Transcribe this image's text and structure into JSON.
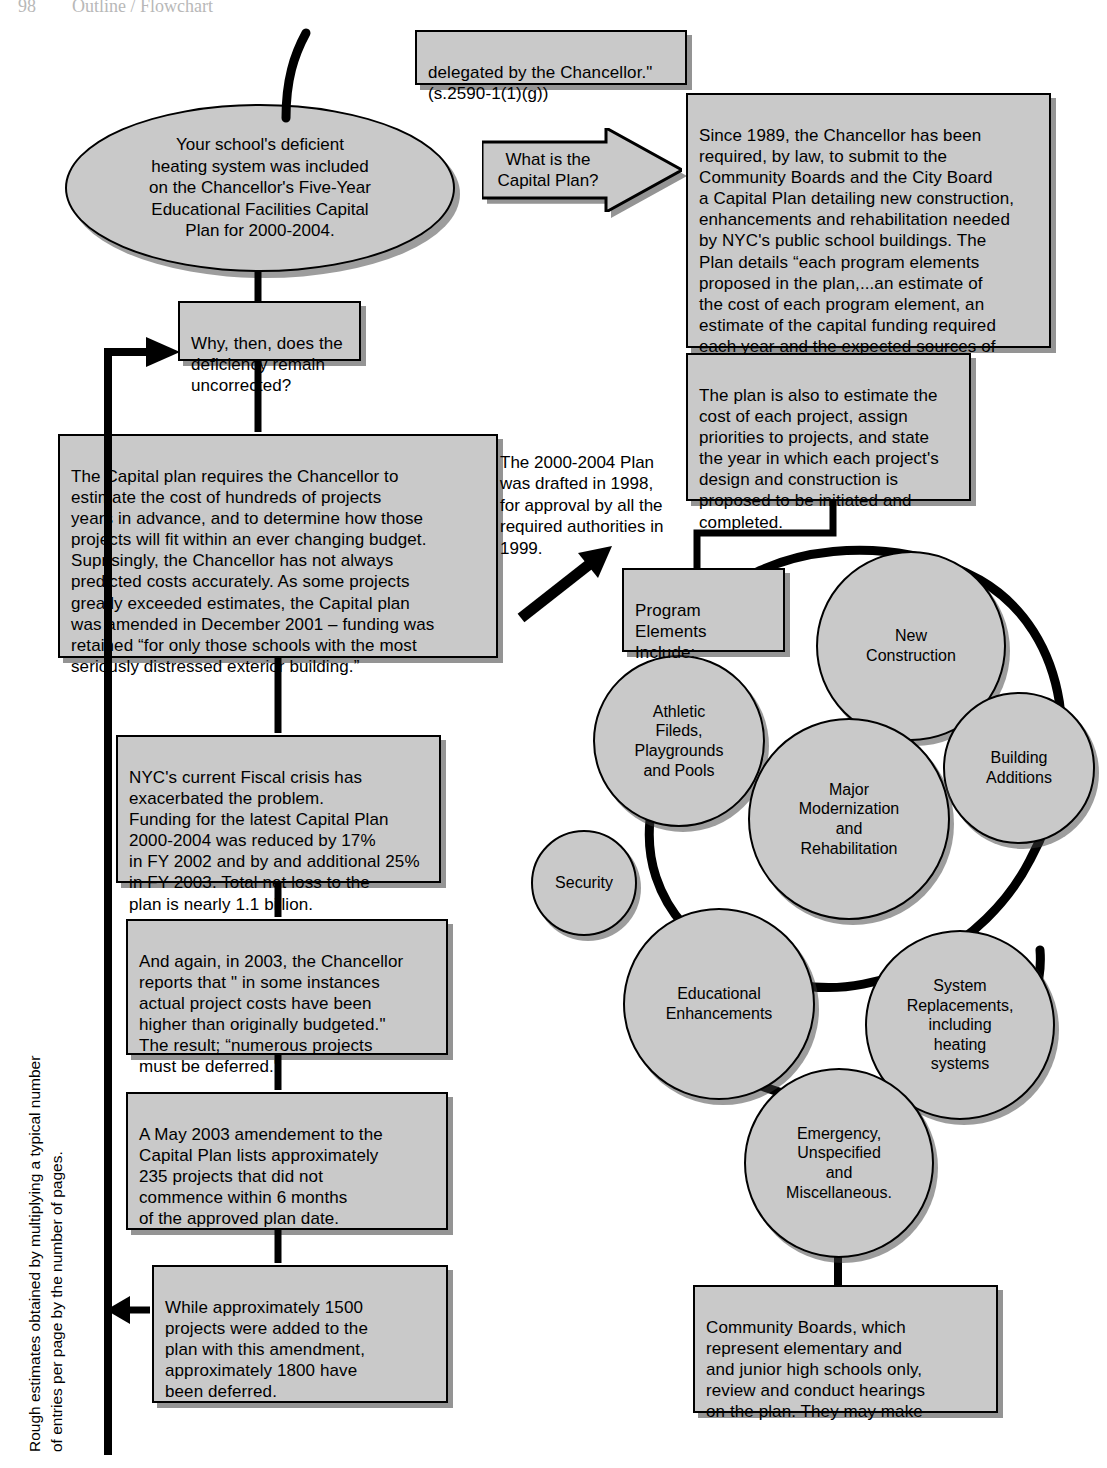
{
  "page": {
    "header_fragment": "98        Outline / Flowchart",
    "width": 1107,
    "height": 1468,
    "fill_color": "#c9c9c9",
    "line_color": "#000000"
  },
  "top_quote_box": {
    "text": "delegated by the Chancellor.\"\n(s.2590-1(1)(g))"
  },
  "start_ellipse": {
    "text": "Your school's deficient\nheating system was included\non the Chancellor's Five-Year\nEducational Facilities Capital\nPlan for 2000-2004."
  },
  "question_arrow": {
    "text": "What is the\nCapital Plan?"
  },
  "capital_plan_box": {
    "text": "Since 1989, the Chancellor has been\nrequired, by law, to submit to the\nCommunity Boards and the City Board\na Capital Plan detailing new construction,\nenhancements and rehabilitation needed\nby NYC's public school buildings. The\nPlan details “each program elements\nproposed in the plan,...an estimate of\nthe cost of each program element, an\nestimate of the capital funding required\neach year and the expected sources of\nsuch funding.” (NYEL s.2590.p)"
  },
  "plan_estimate_box": {
    "text": "The plan is also to estimate the\ncost of each project, assign\npriorities to projects, and state\nthe year in which each project's\ndesign and construction is\nproposed to be initiated and\ncompleted."
  },
  "why_box": {
    "text": "Why, then, does the\ndeficiency remain\nuncorrected?"
  },
  "requires_box": {
    "text": "The Capital plan requires the Chancellor to\nestimate the cost of hundreds of projects\nyears in advance, and to determine how those\nprojects will fit within an ever changing budget.\nSuprisingly, the Chancellor has not always\npredicted costs accurately. As some projects\ngreatly exceeded estimates, the Capital plan\nwas amended in December 2001 – funding was\nretained “for only those schools with the most\nseriously distressed exterior building.”"
  },
  "drafted_note": {
    "text": "The 2000-2004  Plan\nwas drafted in 1998,\nfor approval by all the\nrequired authorities in\n1999."
  },
  "fiscal_box": {
    "text": "NYC's current Fiscal crisis has\nexacerbated the problem.\nFunding for the latest Capital Plan\n2000-2004 was reduced by 17%\nin FY 2002 and by and additional 25%\nin FY 2003. Total net loss to the\nplan is nearly 1.1 billion."
  },
  "again_box": {
    "text": "And again, in 2003, the Chancellor\nreports that \" in some instances\nactual project costs have been\nhigher than originally budgeted.\"\nThe result; “numerous projects\nmust be deferred.\""
  },
  "may2003_box": {
    "text": "A May 2003 amendement to the\nCapital Plan lists approximately\n235 projects that did not\ncommence within 6 months\nof the approved plan date."
  },
  "deferred_box": {
    "text": "While approximately 1500\nprojects were added to the\nplan with this amendment,\napproximately 1800 have\nbeen deferred."
  },
  "margin_note": {
    "text": "Rough estimates obtained by multiplying a typical number\nof entries per page by the number of pages."
  },
  "program_elements_box": {
    "text": "Program\nElements\nInclude:"
  },
  "program_circles": [
    {
      "id": "new-construction",
      "text": "New\nConstruction"
    },
    {
      "id": "building-additions",
      "text": "Building\nAdditions"
    },
    {
      "id": "athletic-fields",
      "text": "Athletic\nFileds,\nPlaygrounds\nand Pools"
    },
    {
      "id": "major-modernization",
      "text": "Major\nModernization\nand\nRehabilitation"
    },
    {
      "id": "security",
      "text": "Security"
    },
    {
      "id": "educational-enhancements",
      "text": "Educational\nEnhancements"
    },
    {
      "id": "system-replacements",
      "text": "System\nReplacements,\nincluding\nheating\nsystems"
    },
    {
      "id": "emergency",
      "text": "Emergency,\nUnspecified\nand\nMiscellaneous."
    }
  ],
  "community_boards_box": {
    "text": "Community Boards, which\nrepresent elementary and\nand junior high schools only,\nreview and conduct hearings\non the plan. They may  make"
  }
}
